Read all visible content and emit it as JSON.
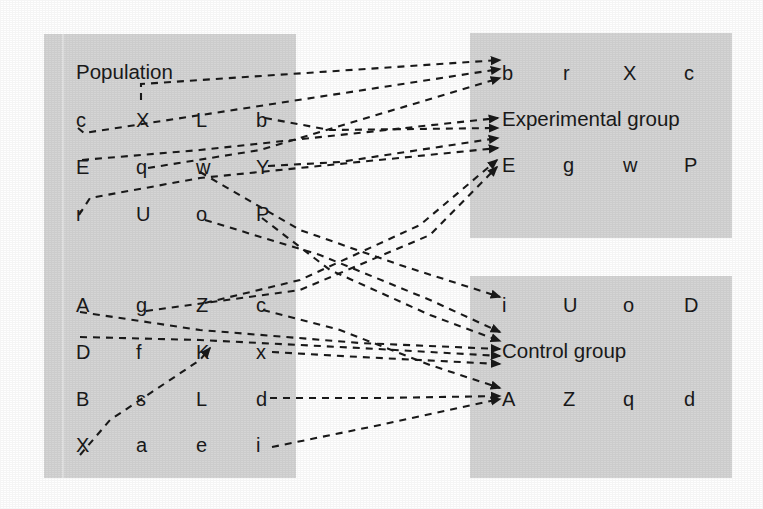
{
  "figure": {
    "background_color": "#ffffff",
    "panel_color": "#d5d5d5",
    "ink_color": "#1a1a1a"
  },
  "population": {
    "title": "Population",
    "rows": [
      [
        "c",
        "X",
        "L",
        "b"
      ],
      [
        "E",
        "q",
        "w",
        "Y"
      ],
      [
        "r",
        "U",
        "o",
        "P"
      ],
      [
        "A",
        "g",
        "Z",
        "c"
      ],
      [
        "D",
        "f",
        "K",
        "x"
      ],
      [
        "B",
        "s",
        "L",
        "d"
      ],
      [
        "X",
        "a",
        "e",
        "i"
      ]
    ]
  },
  "experimental": {
    "title": "Experimental group",
    "row_top": [
      "b",
      "r",
      "X",
      "c"
    ],
    "row_bottom": [
      "E",
      "g",
      "w",
      "P"
    ]
  },
  "control": {
    "title": "Control group",
    "row_top": [
      "i",
      "U",
      "o",
      "D"
    ],
    "row_bottom": [
      "A",
      "Z",
      "q",
      "d"
    ]
  },
  "edges": {
    "style": "dashed-arrow",
    "description": "Selected members of the population are sampled into the experimental group and the control group.",
    "to_experimental": [
      {
        "from": "X",
        "to": "b"
      },
      {
        "from": "c",
        "to": "b"
      },
      {
        "from": "q",
        "to": "b"
      },
      {
        "from": "E",
        "to": "Experimental group"
      },
      {
        "from": "b",
        "to": "Experimental group"
      },
      {
        "from": "Y",
        "to": "Experimental group"
      },
      {
        "from": "r",
        "to": "Experimental group"
      },
      {
        "from": "Z",
        "to": "E"
      },
      {
        "from": "g",
        "to": "E"
      }
    ],
    "to_control": [
      {
        "from": "w",
        "to": "i"
      },
      {
        "from": "o",
        "to": "Control group"
      },
      {
        "from": "P",
        "to": "Control group"
      },
      {
        "from": "A",
        "to": "Control group"
      },
      {
        "from": "D",
        "to": "Control group"
      },
      {
        "from": "x",
        "to": "Control group"
      },
      {
        "from": "c",
        "to": "A"
      },
      {
        "from": "d",
        "to": "A"
      },
      {
        "from": "i",
        "to": "A"
      },
      {
        "from": "B",
        "to": "K"
      }
    ]
  }
}
